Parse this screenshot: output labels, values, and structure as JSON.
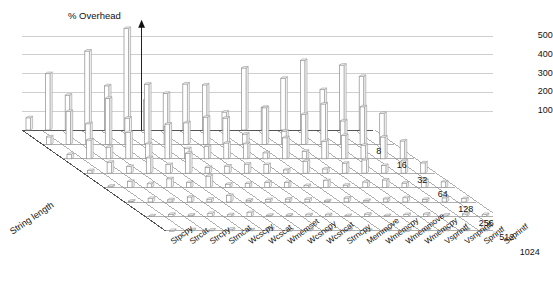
{
  "chart_data": {
    "type": "bar",
    "title": "",
    "ylabel": "% Overhead",
    "xlabel": "",
    "zlabel": "String length",
    "ylim": [
      0,
      560
    ],
    "yticks": [
      100,
      200,
      300,
      400,
      500
    ],
    "grid": true,
    "legend_position": "none",
    "projection": "3d-isometric",
    "categories": [
      "Stpcpy",
      "Strcat",
      "Strcpy",
      "Strncat",
      "Wcscpy",
      "Wcscat",
      "Wmemset",
      "Wcsncpy",
      "Wcsncat",
      "Strncpy",
      "Memmove",
      "Wmemcpy",
      "Wmemmove",
      "Wmemcpy",
      "Vsprintf",
      "Vsnprintf",
      "Sprintf",
      "Snprintf"
    ],
    "depth_categories": [
      "8",
      "16",
      "32",
      "64",
      "128",
      "256",
      "512",
      "1024"
    ],
    "series": [
      {
        "name": "8",
        "values": [
          65,
          300,
          185,
          420,
          235,
          540,
          160,
          195,
          245,
          240,
          95,
          330,
          120,
          275,
          370,
          215,
          345,
          285
        ]
      },
      {
        "name": "16",
        "values": [
          40,
          175,
          110,
          245,
          140,
          320,
          95,
          115,
          145,
          140,
          55,
          195,
          70,
          160,
          215,
          125,
          200,
          165
        ]
      },
      {
        "name": "32",
        "values": [
          24,
          100,
          62,
          140,
          80,
          185,
          54,
          66,
          84,
          80,
          32,
          112,
          40,
          92,
          124,
          72,
          116,
          95
        ]
      },
      {
        "name": "64",
        "values": [
          14,
          58,
          36,
          82,
          46,
          106,
          31,
          38,
          48,
          46,
          18,
          64,
          23,
          53,
          71,
          41,
          66,
          55
        ]
      },
      {
        "name": "128",
        "values": [
          8,
          33,
          21,
          47,
          27,
          61,
          18,
          22,
          28,
          27,
          11,
          37,
          13,
          30,
          41,
          24,
          38,
          31
        ]
      },
      {
        "name": "256",
        "values": [
          5,
          19,
          12,
          27,
          15,
          35,
          10,
          13,
          16,
          15,
          6,
          21,
          8,
          17,
          23,
          14,
          22,
          18
        ]
      },
      {
        "name": "512",
        "values": [
          3,
          11,
          7,
          16,
          9,
          20,
          6,
          7,
          9,
          9,
          4,
          12,
          4,
          10,
          13,
          8,
          13,
          10
        ]
      },
      {
        "name": "1024",
        "values": [
          2,
          6,
          4,
          9,
          5,
          11,
          3,
          4,
          5,
          5,
          2,
          7,
          2,
          6,
          8,
          5,
          7,
          6
        ]
      }
    ]
  },
  "axes": {
    "y_axis_title": "% Overhead",
    "z_axis_title": "String length"
  }
}
